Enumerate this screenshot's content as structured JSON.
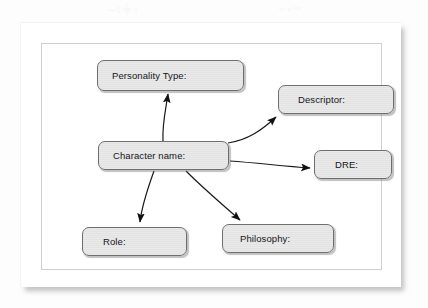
{
  "diagram": {
    "artifacts": {
      "smudge_a": "∼ʕ⸎ ǀ",
      "smudge_b": "∼ᴠᵗᵉˢ"
    },
    "colors": {
      "node_fill": "#e6e6e6",
      "node_border": "#6e6e6e",
      "edge": "#1a1a1a",
      "page": "#ffffff",
      "frame_border": "#cfcfcf",
      "text": "#15151a"
    },
    "nodes": [
      {
        "id": "personality",
        "label": "Personality Type:"
      },
      {
        "id": "descriptor",
        "label": "Descriptor:"
      },
      {
        "id": "character",
        "label": "Character name:"
      },
      {
        "id": "dre",
        "label": "DRE:"
      },
      {
        "id": "role",
        "label": "Role:"
      },
      {
        "id": "philosophy",
        "label": "Philosophy:"
      }
    ],
    "edges": [
      {
        "from": "character",
        "to": "personality",
        "style": "curved-arrow",
        "direction": "up"
      },
      {
        "from": "character",
        "to": "descriptor",
        "style": "curved-arrow",
        "direction": "up-right"
      },
      {
        "from": "character",
        "to": "dre",
        "style": "curved-arrow",
        "direction": "right-down"
      },
      {
        "from": "character",
        "to": "role",
        "style": "curved-arrow",
        "direction": "down-left"
      },
      {
        "from": "character",
        "to": "philosophy",
        "style": "curved-arrow",
        "direction": "down-right"
      }
    ]
  }
}
